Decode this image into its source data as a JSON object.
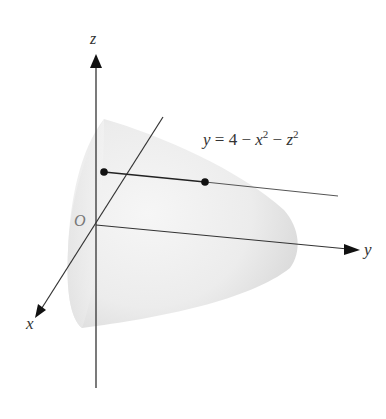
{
  "figure": {
    "surface_equation": {
      "lhs": "y",
      "eq": " = 4 − ",
      "x": "x",
      "exp1": "2",
      "minus": " − ",
      "z": "z",
      "exp2": "2"
    },
    "axes": {
      "z_label": "z",
      "y_label": "y",
      "x_label": "x",
      "origin_label": "O"
    },
    "colors": {
      "axis": "#333333",
      "surface_light": "#f4f4f4",
      "surface_dark": "#d9d9d9",
      "point": "#111111"
    }
  }
}
